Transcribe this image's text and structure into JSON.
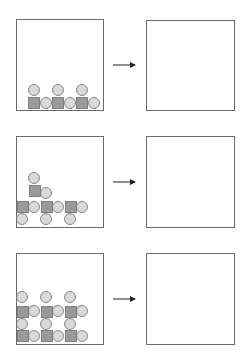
{
  "diagram": {
    "rows": [
      {
        "id": "row-1",
        "left_box": {
          "x": 16,
          "y": 19,
          "w": 87,
          "h": 91
        },
        "arrow": {
          "x1": 113,
          "y1": 65,
          "x2": 135,
          "y2": 65
        },
        "right_box": {
          "x": 146,
          "y": 20,
          "w": 88,
          "h": 90
        },
        "squares": [
          [
            28,
            97
          ],
          [
            52,
            97
          ],
          [
            76,
            97
          ]
        ],
        "circles": [
          [
            34,
            90
          ],
          [
            58,
            90
          ],
          [
            82,
            90
          ],
          [
            46,
            103
          ],
          [
            70,
            103
          ],
          [
            94,
            103
          ]
        ]
      },
      {
        "id": "row-2",
        "left_box": {
          "x": 16,
          "y": 136,
          "w": 87,
          "h": 91
        },
        "arrow": {
          "x1": 113,
          "y1": 182,
          "x2": 135,
          "y2": 182
        },
        "right_box": {
          "x": 146,
          "y": 136,
          "w": 88,
          "h": 91
        },
        "squares": [
          [
            17,
            201
          ],
          [
            41,
            201
          ],
          [
            65,
            201
          ],
          [
            29,
            185
          ]
        ],
        "circles": [
          [
            22,
            219
          ],
          [
            46,
            219
          ],
          [
            70,
            219
          ],
          [
            34,
            207
          ],
          [
            58,
            207
          ],
          [
            82,
            207
          ],
          [
            46,
            193
          ],
          [
            34,
            178
          ]
        ]
      },
      {
        "id": "row-3",
        "left_box": {
          "x": 16,
          "y": 253,
          "w": 87,
          "h": 91
        },
        "arrow": {
          "x1": 113,
          "y1": 299,
          "x2": 135,
          "y2": 299
        },
        "right_box": {
          "x": 146,
          "y": 253,
          "w": 88,
          "h": 91
        },
        "squares": [
          [
            17,
            330
          ],
          [
            41,
            330
          ],
          [
            65,
            330
          ],
          [
            17,
            306
          ],
          [
            41,
            306
          ],
          [
            65,
            306
          ]
        ],
        "circles": [
          [
            34,
            336
          ],
          [
            58,
            336
          ],
          [
            82,
            336
          ],
          [
            22,
            324
          ],
          [
            46,
            324
          ],
          [
            70,
            324
          ],
          [
            34,
            311
          ],
          [
            58,
            311
          ],
          [
            82,
            311
          ],
          [
            22,
            297
          ],
          [
            46,
            297
          ],
          [
            70,
            297
          ]
        ]
      }
    ],
    "shape_size": 11,
    "colors": {
      "box_stroke": "#6b6b6b",
      "square_fill": "#9a9a9a",
      "circle_fill": "#d9d9d9",
      "shape_stroke": "#6e6e6e",
      "arrow": "#222222"
    }
  }
}
